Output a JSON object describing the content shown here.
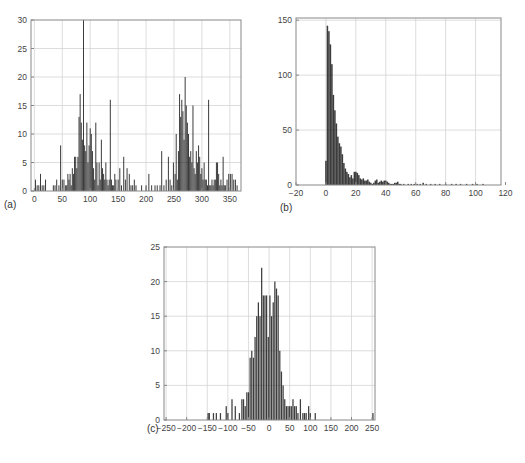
{
  "chart_data": [
    {
      "id": "a",
      "type": "bar",
      "panel_label": "(a)",
      "title": "",
      "xlabel": "",
      "ylabel": "",
      "xlim": [
        -6,
        370
      ],
      "ylim": [
        0,
        30
      ],
      "xticks": [
        0,
        50,
        100,
        150,
        200,
        250,
        300,
        350
      ],
      "yticks": [
        0,
        5,
        10,
        15,
        20,
        25,
        30
      ],
      "grid": true,
      "bin_width": 1.5,
      "x": [
        2,
        5,
        8,
        11,
        14,
        17,
        20,
        34,
        37,
        40,
        44,
        47,
        50,
        53,
        56,
        58,
        60,
        62,
        64,
        66,
        68,
        70,
        72,
        74,
        76,
        78,
        80,
        82,
        84,
        86,
        88,
        90,
        92,
        94,
        96,
        98,
        100,
        102,
        104,
        106,
        108,
        110,
        112,
        114,
        116,
        118,
        120,
        122,
        124,
        126,
        128,
        130,
        132,
        134,
        136,
        138,
        140,
        142,
        144,
        146,
        150,
        153,
        156,
        160,
        163,
        166,
        170,
        173,
        176,
        179,
        182,
        192,
        200,
        205,
        210,
        216,
        220,
        225,
        228,
        232,
        236,
        240,
        243,
        246,
        249,
        252,
        254,
        256,
        258,
        260,
        262,
        264,
        266,
        268,
        270,
        272,
        274,
        276,
        278,
        280,
        282,
        284,
        286,
        288,
        290,
        292,
        294,
        296,
        298,
        300,
        302,
        304,
        306,
        308,
        310,
        312,
        314,
        316,
        318,
        320,
        322,
        324,
        326,
        328,
        330,
        332,
        334,
        336,
        338,
        340,
        342,
        345,
        348,
        351,
        354,
        357,
        360,
        363
      ],
      "values": [
        2,
        1,
        1,
        3,
        1,
        1,
        2,
        1,
        1,
        2,
        1,
        8,
        2,
        2,
        1,
        1,
        3,
        2,
        3,
        1,
        4,
        3,
        6,
        6,
        4,
        6,
        13,
        17,
        12,
        9,
        30,
        8,
        7,
        12,
        5,
        8,
        11,
        10,
        7,
        4,
        2,
        12,
        5,
        1,
        5,
        2,
        9,
        4,
        3,
        2,
        5,
        2,
        1,
        2,
        16,
        2,
        1,
        1,
        3,
        2,
        2,
        4,
        1,
        6,
        2,
        4,
        3,
        1,
        1,
        2,
        1,
        1,
        1,
        3,
        1,
        1,
        1,
        1,
        7,
        1,
        2,
        6,
        2,
        1,
        5,
        3,
        10,
        2,
        7,
        17,
        13,
        16,
        14,
        9,
        20,
        15,
        12,
        10,
        6,
        7,
        5,
        15,
        4,
        3,
        7,
        5,
        8,
        6,
        3,
        4,
        2,
        5,
        2,
        2,
        1,
        16,
        1,
        1,
        2,
        1,
        2,
        2,
        5,
        5,
        3,
        1,
        2,
        1,
        6,
        1,
        1,
        2,
        3,
        3,
        3,
        2,
        2,
        1
      ]
    },
    {
      "id": "b",
      "type": "bar",
      "panel_label": "(b)",
      "title": "",
      "xlabel": "",
      "ylabel": "",
      "xlim": [
        -20,
        117
      ],
      "ylim": [
        0,
        152
      ],
      "xticks": [
        -20,
        0,
        20,
        40,
        60,
        80,
        100,
        120
      ],
      "yticks": [
        0,
        50,
        100,
        150
      ],
      "grid": true,
      "bin_width": 1,
      "x": [
        0,
        1,
        2,
        3,
        4,
        5,
        6,
        7,
        8,
        9,
        10,
        11,
        12,
        13,
        14,
        15,
        16,
        17,
        18,
        19,
        20,
        21,
        22,
        23,
        24,
        25,
        26,
        27,
        28,
        29,
        30,
        31,
        32,
        33,
        34,
        35,
        36,
        37,
        38,
        39,
        40,
        41,
        42,
        43,
        44,
        45,
        46,
        47,
        48,
        49,
        50,
        52,
        55,
        57,
        59,
        61,
        63,
        65,
        67,
        70,
        73,
        76,
        80,
        84,
        87,
        90,
        94,
        98,
        101,
        105
      ],
      "values": [
        22,
        145,
        140,
        128,
        110,
        82,
        68,
        56,
        44,
        38,
        35,
        28,
        20,
        15,
        12,
        10,
        7,
        9,
        6,
        12,
        12,
        11,
        9,
        6,
        5,
        6,
        4,
        4,
        5,
        3,
        2,
        1,
        2,
        4,
        5,
        2,
        3,
        4,
        3,
        4,
        4,
        3,
        2,
        1,
        1,
        1,
        2,
        2,
        3,
        1,
        1,
        1,
        1,
        1,
        1,
        1,
        1,
        2,
        1,
        1,
        1,
        1,
        1,
        1,
        1,
        1,
        1,
        1,
        1,
        1
      ]
    },
    {
      "id": "c",
      "type": "bar",
      "panel_label": "(c)",
      "title": "",
      "xlabel": "",
      "ylabel": "",
      "xlim": [
        -255,
        257
      ],
      "ylim": [
        0,
        25
      ],
      "xticks": [
        -250,
        -200,
        -150,
        -100,
        -50,
        0,
        50,
        100,
        150,
        200,
        250
      ],
      "yticks": [
        0,
        5,
        10,
        15,
        20,
        25
      ],
      "grid": true,
      "bin_width": 3,
      "x": [
        -148,
        -145,
        -135,
        -128,
        -118,
        -104,
        -100,
        -90,
        -82,
        -72,
        -66,
        -62,
        -58,
        -54,
        -50,
        -46,
        -42,
        -38,
        -34,
        -30,
        -26,
        -22,
        -18,
        -14,
        -10,
        -6,
        -2,
        2,
        6,
        10,
        14,
        18,
        22,
        26,
        30,
        34,
        38,
        42,
        46,
        50,
        54,
        58,
        62,
        66,
        70,
        76,
        82,
        86,
        90,
        96,
        100,
        112,
        252
      ],
      "values": [
        1,
        1,
        1,
        1,
        1,
        2,
        1,
        3,
        2,
        1,
        3,
        3,
        2,
        4,
        4,
        9,
        10,
        9,
        12,
        15,
        17,
        15,
        22,
        18,
        18,
        18,
        12,
        18,
        15,
        17,
        20,
        19,
        18,
        10,
        7,
        5,
        3,
        2,
        2,
        2,
        2,
        3,
        2,
        2,
        1,
        3,
        1,
        1,
        1,
        2,
        1,
        1,
        1
      ]
    }
  ],
  "layout": {
    "bar_color": "#1a1a1a",
    "grid_color": "#d4d4d4",
    "axis_color": "#888888",
    "plots": {
      "a": {
        "left": 31,
        "top": 20,
        "right": 241,
        "bottom": 191,
        "label_x": 4,
        "label_y": 199
      },
      "b": {
        "left": 296,
        "top": 18,
        "right": 501,
        "bottom": 185,
        "label_x": 280,
        "label_y": 202
      },
      "c": {
        "left": 164,
        "top": 247,
        "right": 375,
        "bottom": 420,
        "label_x": 147,
        "label_y": 423
      }
    }
  }
}
